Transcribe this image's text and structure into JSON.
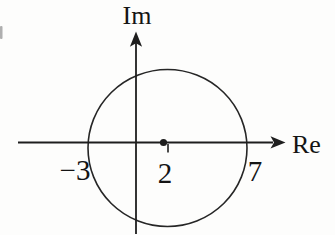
{
  "figure": {
    "type": "complex-plane-diagram",
    "axis_labels": {
      "vertical": "Im",
      "horizontal": "Re"
    },
    "point_labels": {
      "left_intercept": "−3",
      "center": "2",
      "right_intercept": "7"
    },
    "colors": {
      "background": "#fdfdfc",
      "ink": "#1e1e1e",
      "artifact": "#6f6f6f"
    }
  }
}
